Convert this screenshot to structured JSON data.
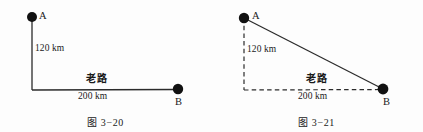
{
  "figures": [
    {
      "id": "figure-3-20",
      "caption": "图 3−20",
      "point_a_label": "A",
      "point_b_label": "B",
      "vertical_label": "120 km",
      "horizontal_label": "200 km",
      "road_label": "老路",
      "line_style": "solid",
      "description": "Right-angle path from A down then across to B",
      "geometry": {
        "point_a": [
          32,
          17
        ],
        "corner": [
          32,
          90
        ],
        "point_b": [
          178,
          89
        ],
        "vertical_km": 120,
        "horizontal_km": 200
      }
    },
    {
      "id": "figure-3-21",
      "caption": "图 3−21",
      "point_a_label": "A",
      "point_b_label": "B",
      "vertical_label": "120 km",
      "horizontal_label": "200 km",
      "road_label": "老路",
      "line_style": "dashed-legs-solid-hypotenuse",
      "description": "Right triangle with dashed legs and solid hypotenuse from A to B",
      "geometry": {
        "point_a": [
          33,
          18
        ],
        "corner": [
          33,
          90
        ],
        "point_b": [
          172,
          89
        ],
        "vertical_km": 120,
        "horizontal_km": 200
      }
    }
  ],
  "style": {
    "stroke_color": "#2b2b2b",
    "point_color": "#111111",
    "background": "#fdfdfd",
    "point_radius": 5,
    "stroke_width": 1.3
  }
}
